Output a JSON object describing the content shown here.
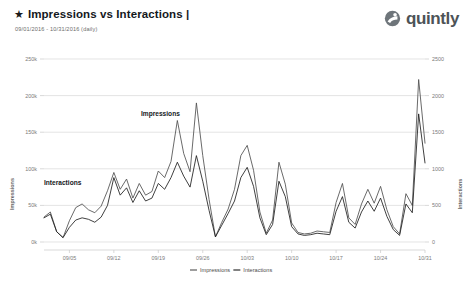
{
  "header": {
    "star_icon": "★",
    "title": "Impressions vs Interactions |",
    "subtitle": "09/01/2016 - 10/31/2016 (daily)",
    "logo_text": "quintly",
    "logo_icon": "quintly-logo-icon"
  },
  "colors": {
    "impressions": "#4f4f4f",
    "interactions": "#1d1d1d",
    "grid": "#d8d8d8",
    "text": "#7b7b7b",
    "logo": "#4d5357"
  },
  "annotations": {
    "impressions": "Impressions",
    "interactions": "Interactions"
  },
  "legend": {
    "items": [
      {
        "label": "Impressions",
        "color": "#4f4f4f"
      },
      {
        "label": "Interactions",
        "color": "#1d1d1d"
      }
    ]
  },
  "chart_data": {
    "type": "line",
    "title": "Impressions vs Interactions |",
    "subtitle": "09/01/2016 - 10/31/2016 (daily)",
    "xlabel": "",
    "ylabel": "Impressions",
    "y2label": "Interactions",
    "grid": true,
    "legend_position": "bottom",
    "ylim": [
      0,
      250000
    ],
    "y2lim": [
      0,
      2500
    ],
    "yticks": [
      0,
      50000,
      100000,
      150000,
      200000,
      250000
    ],
    "yticklabels": [
      "0k",
      "50k",
      "100k",
      "150k",
      "200k",
      "250k"
    ],
    "y2ticks": [
      0,
      500,
      1000,
      1500,
      2000,
      2500
    ],
    "y2ticklabels": [
      "0",
      "500",
      "1000",
      "1500",
      "2000",
      "2500"
    ],
    "xticklabels": [
      "09/05",
      "09/12",
      "09/19",
      "09/26",
      "10/03",
      "10/10",
      "10/17",
      "10/24",
      "10/31"
    ],
    "xtickindices": [
      4,
      11,
      18,
      25,
      32,
      39,
      46,
      53,
      60
    ],
    "x": [
      "09/01",
      "09/02",
      "09/03",
      "09/04",
      "09/05",
      "09/06",
      "09/07",
      "09/08",
      "09/09",
      "09/10",
      "09/11",
      "09/12",
      "09/13",
      "09/14",
      "09/15",
      "09/16",
      "09/17",
      "09/18",
      "09/19",
      "09/20",
      "09/21",
      "09/22",
      "09/23",
      "09/24",
      "09/25",
      "09/26",
      "09/27",
      "09/28",
      "09/29",
      "09/30",
      "10/01",
      "10/02",
      "10/03",
      "10/04",
      "10/05",
      "10/06",
      "10/07",
      "10/08",
      "10/09",
      "10/10",
      "10/11",
      "10/12",
      "10/13",
      "10/14",
      "10/15",
      "10/16",
      "10/17",
      "10/18",
      "10/19",
      "10/20",
      "10/21",
      "10/22",
      "10/23",
      "10/24",
      "10/25",
      "10/26",
      "10/27",
      "10/28",
      "10/29",
      "10/30",
      "10/31"
    ],
    "series": [
      {
        "name": "Impressions",
        "axis": "left",
        "color": "#4f4f4f",
        "values": [
          34000,
          41000,
          14000,
          6000,
          29000,
          47000,
          52000,
          44000,
          40000,
          49000,
          70000,
          95000,
          72000,
          86000,
          60000,
          80000,
          64000,
          69000,
          97000,
          88000,
          110000,
          166000,
          121000,
          96000,
          190000,
          118000,
          58000,
          7000,
          27000,
          45000,
          72000,
          118000,
          132000,
          98000,
          41000,
          12000,
          30000,
          109000,
          79000,
          26000,
          13000,
          11000,
          12000,
          15000,
          14000,
          13000,
          54000,
          80000,
          33000,
          24000,
          52000,
          72000,
          53000,
          76000,
          44000,
          21000,
          11000,
          66000,
          50000,
          222000,
          135000
        ]
      },
      {
        "name": "Interactions",
        "axis": "right",
        "color": "#1d1d1d",
        "values": [
          330,
          380,
          140,
          60,
          200,
          300,
          330,
          310,
          270,
          340,
          500,
          880,
          640,
          740,
          540,
          700,
          560,
          600,
          800,
          720,
          880,
          1090,
          900,
          750,
          1180,
          830,
          430,
          70,
          230,
          390,
          560,
          880,
          1020,
          760,
          330,
          100,
          240,
          830,
          620,
          210,
          110,
          90,
          100,
          120,
          110,
          100,
          420,
          620,
          270,
          190,
          410,
          560,
          420,
          600,
          350,
          170,
          90,
          520,
          400,
          1750,
          1080
        ]
      }
    ]
  }
}
